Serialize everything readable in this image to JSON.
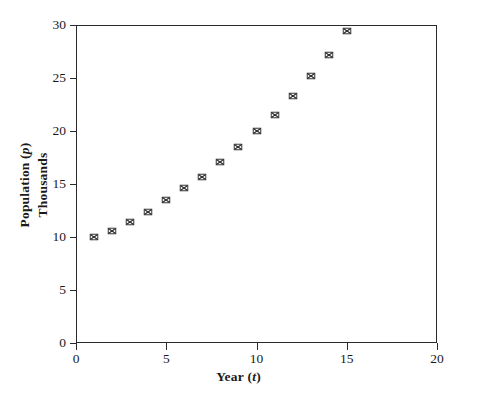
{
  "chart_data": {
    "type": "scatter",
    "title": "",
    "xlabel": "Year (t)",
    "xlabel_plain": "Year",
    "xlabel_variable": "t",
    "ylabel": "Population (p)",
    "ylabel_plain": "Population",
    "ylabel_variable": "p",
    "ylabel_line2": "Thousands",
    "xlim": [
      0,
      20
    ],
    "ylim": [
      0,
      30
    ],
    "xticks": [
      0,
      5,
      10,
      15,
      20
    ],
    "yticks": [
      0,
      5,
      10,
      15,
      20,
      25,
      30
    ],
    "xtick_labels": [
      "0",
      "5",
      "10",
      "15",
      "20"
    ],
    "ytick_labels": [
      "0",
      "5",
      "10",
      "15",
      "20",
      "25",
      "30"
    ],
    "grid": false,
    "legend": false,
    "marker_style": "boxed-x",
    "marker_color": "#2a2a2a",
    "frame": true,
    "x": [
      1,
      2,
      3,
      4,
      5,
      6,
      7,
      8,
      9,
      10,
      11,
      12,
      13,
      14,
      15
    ],
    "values": [
      10.0,
      10.6,
      11.4,
      12.4,
      13.5,
      14.6,
      15.7,
      17.1,
      18.5,
      20.0,
      21.5,
      23.3,
      25.2,
      27.2,
      29.4
    ],
    "series": [
      {
        "name": "Population",
        "x": [
          1,
          2,
          3,
          4,
          5,
          6,
          7,
          8,
          9,
          10,
          11,
          12,
          13,
          14,
          15
        ],
        "values": [
          10.0,
          10.6,
          11.4,
          12.4,
          13.5,
          14.6,
          15.7,
          17.1,
          18.5,
          20.0,
          21.5,
          23.3,
          25.2,
          27.2,
          29.4
        ]
      }
    ]
  },
  "axes": {
    "plot_left_px": 76,
    "plot_top_px": 25,
    "plot_width_px": 361,
    "plot_height_px": 318
  },
  "colors": {
    "background": "#ffffff",
    "axis": "#2a2a2a",
    "marker": "#2a2a2a",
    "text": "#1a1a1a"
  }
}
